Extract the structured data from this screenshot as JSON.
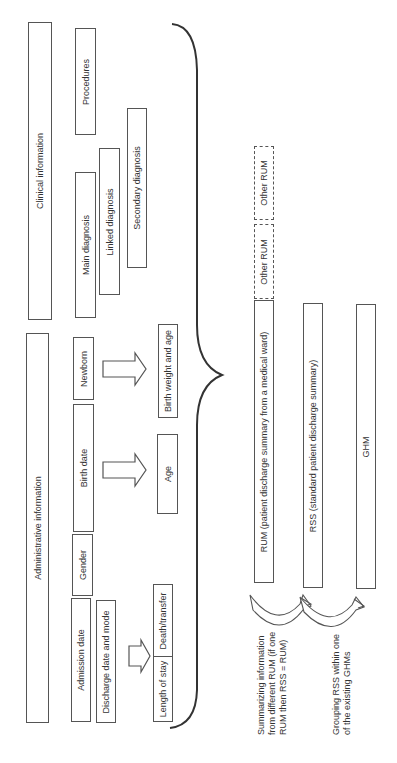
{
  "diagram": {
    "top_level": {
      "clinical": "Clinical information",
      "administrative": "Administrative information"
    },
    "clinical_items": {
      "procedures": "Procedures",
      "main_diagnosis": "Main diagnosis",
      "linked_diagnosis": "Linked diagnosis",
      "secondary_diagnosis": "Secondary diagnosis"
    },
    "administrative_items": {
      "newborn": "Newborn",
      "birth_date": "Birth date",
      "gender": "Gender",
      "admission_date": "Admission date",
      "discharge": "Discharge date and mode"
    },
    "derived": {
      "birth_weight_age": "Birth weight and age",
      "age": "Age",
      "death_transfer": "Death/transfer",
      "length_of_stay": "Length of stay"
    },
    "outputs": {
      "other_rum_1": "Other RUM",
      "other_rum_2": "Other RUM",
      "rum": "RUM (patient discharge summary from a medical ward)",
      "rss": "RSS (standard patient discharge summary)",
      "ghm": "GHM"
    },
    "annotations": {
      "summarizing_line1": "Summarizing information",
      "summarizing_line2": "from different RUM (if one",
      "summarizing_line3": "RUM then RSS = RUM)",
      "grouping_line1": "Grouping RSS within one",
      "grouping_line2": "of the existing GHMs"
    },
    "colors": {
      "stroke": "#555555",
      "text": "#333333",
      "background": "#ffffff"
    }
  }
}
